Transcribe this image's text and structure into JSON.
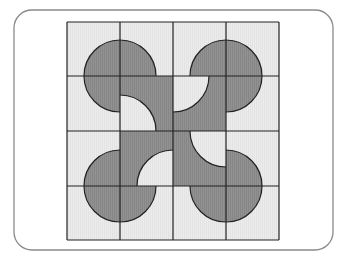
{
  "figure": {
    "frame": {
      "x": 14,
      "y": 10,
      "width": 319,
      "height": 240,
      "radius": 18,
      "stroke": "#8a8a8a"
    },
    "grid": {
      "x": 67,
      "y": 22,
      "cols": [
        67,
        120,
        173,
        226,
        279
      ],
      "rows": [
        22,
        76,
        131,
        186,
        240
      ],
      "line_color": "#222222",
      "light_fill": "#e9e9e9",
      "dark_fill": "#8e8e8e"
    },
    "circles": [
      {
        "name": "circle-top-left",
        "cx": 120,
        "cy": 76,
        "r": 36,
        "missing_quadrant": "bottom-right"
      },
      {
        "name": "circle-top-right",
        "cx": 226,
        "cy": 76,
        "r": 36,
        "missing_quadrant": "bottom-left"
      },
      {
        "name": "circle-bottom-left",
        "cx": 120,
        "cy": 186,
        "r": 36,
        "missing_quadrant": "top-right"
      },
      {
        "name": "circle-bottom-right",
        "cx": 226,
        "cy": 186,
        "r": 36,
        "missing_quadrant": "top-left"
      }
    ],
    "center_block": {
      "x": 120,
      "y": 76,
      "width": 106,
      "height": 110
    },
    "cutouts": [
      {
        "name": "cutout-top-left-cell",
        "cx": 120,
        "cy": 131,
        "r": 36,
        "quadrant": "top-right"
      },
      {
        "name": "cutout-top-right-cell",
        "cx": 173,
        "cy": 76,
        "r": 36,
        "quadrant": "bottom-right"
      },
      {
        "name": "cutout-bottom-left-cell",
        "cx": 173,
        "cy": 186,
        "r": 36,
        "quadrant": "top-left"
      },
      {
        "name": "cutout-bottom-right-cell",
        "cx": 226,
        "cy": 131,
        "r": 36,
        "quadrant": "bottom-left"
      }
    ]
  }
}
